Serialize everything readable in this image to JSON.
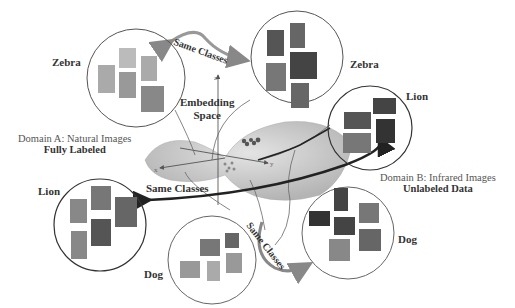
{
  "figure": {
    "center_label": "Embedding Space",
    "center_label_lines": [
      "Embedding",
      "Space"
    ],
    "axes": {
      "x": "x",
      "y": "y",
      "z": "z"
    },
    "same_classes_label": "Same Classes",
    "domain_a": {
      "title": "Domain A:  Natural Images",
      "subtitle": "Fully Labeled"
    },
    "domain_b": {
      "title": "Domain B:  Infrared Images",
      "subtitle": "Unlabeled Data"
    },
    "clusters": [
      {
        "id": "zebra-natural",
        "label": "Zebra",
        "domain": "A",
        "image_count": 6
      },
      {
        "id": "zebra-infrared",
        "label": "Zebra",
        "domain": "B",
        "image_count": 6
      },
      {
        "id": "lion-infrared",
        "label": "Lion",
        "domain": "B",
        "image_count": 5
      },
      {
        "id": "lion-natural",
        "label": "Lion",
        "domain": "A",
        "image_count": 6
      },
      {
        "id": "dog-natural",
        "label": "Dog",
        "domain": "A",
        "image_count": 6
      },
      {
        "id": "dog-infrared",
        "label": "Dog",
        "domain": "B",
        "image_count": 6
      }
    ],
    "colors": {
      "circle": "#555555",
      "arrow": "#888888",
      "dark_arrow": "#222222",
      "manifold": "#c8c8c8",
      "manifold_dark": "#a8a8a8"
    }
  }
}
